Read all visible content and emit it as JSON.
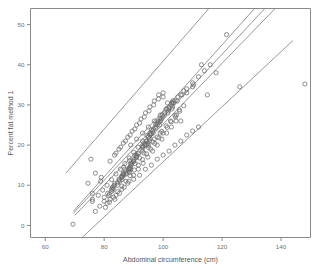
{
  "chart_data": {
    "type": "scatter",
    "title": "",
    "subtitle": "",
    "xlabel": "Abdominal circumference (cm)",
    "ylabel": "Percent fat method 1",
    "xlim": [
      55,
      150
    ],
    "ylim": [
      -3,
      54
    ],
    "xticks": [
      60,
      80,
      100,
      120,
      140
    ],
    "xticklabels": [
      "60",
      "80",
      "100",
      "120",
      "140"
    ],
    "yticks": [
      0,
      10,
      20,
      30,
      40,
      50
    ],
    "yticklabels": [
      "0",
      "10",
      "20",
      "30",
      "40",
      "50"
    ],
    "grid": false,
    "legend": "none",
    "marker": "open-circle",
    "marker_color": "#6b6b6b",
    "line_color": "#6b6b6b",
    "frame_color": "#8a8a8a",
    "series": [
      {
        "name": "Percent fat method 1 vs abdominal circumference",
        "type": "scatter",
        "x": [
          69.4,
          78.8,
          86.6,
          88.6,
          82.5,
          83.6,
          90.9,
          88.5,
          82.5,
          88.6,
          83.3,
          85.1,
          95.5,
          88.2,
          85.3,
          76.0,
          95.0,
          101.8,
          88.6,
          90.4,
          95.6,
          91.6,
          93.9,
          103.0,
          95.4,
          96.6,
          98.8,
          95.4,
          88.7,
          94.8,
          88.5,
          86.0,
          81.2,
          82.8,
          94.4,
          86.7,
          93.2,
          86.0,
          97.3,
          98.4,
          81.8,
          99.5,
          98.0,
          76.0,
          86.5,
          87.4,
          90.2,
          90.0,
          86.0,
          80.0,
          83.4,
          95.0,
          92.8,
          85.0,
          89.4,
          102.7,
          100.0,
          99.1,
          110.3,
          103.3,
          97.8,
          96.4,
          92.9,
          95.8,
          89.8,
          91.0,
          87.4,
          93.8,
          110.0,
          99.7,
          86.4,
          96.7,
          94.2,
          89.2,
          88.9,
          101.3,
          98.3,
          93.5,
          91.0,
          86.5,
          83.0,
          84.5,
          86.0,
          88.5,
          90.0,
          91.5,
          93.0,
          94.5,
          96.0,
          97.5,
          99.0,
          100.5,
          102.0,
          103.5,
          78.0,
          79.5,
          81.0,
          82.5,
          84.0,
          85.5,
          87.0,
          88.5,
          90.0,
          91.5,
          93.0,
          94.5,
          96.0,
          97.5,
          99.0,
          100.5,
          102.0,
          104.0,
          106.0,
          108.0,
          110.0,
          112.0,
          114.0,
          116.0,
          118.0,
          121.5,
          126.0,
          148.1,
          83.6,
          85.2,
          86.8,
          88.4,
          90.0,
          91.6,
          93.2,
          94.8,
          96.4,
          98.0,
          99.6,
          101.2,
          102.8,
          104.4,
          80.4,
          81.8,
          83.2,
          84.6,
          86.0,
          87.4,
          88.8,
          90.2,
          91.6,
          93.0,
          94.4,
          95.8,
          97.2,
          98.6,
          100.0,
          101.4,
          102.8,
          104.2,
          105.6,
          107.0,
          77.0,
          78.5,
          80.0,
          81.5,
          83.0,
          84.5,
          86.0,
          87.5,
          89.0,
          90.5,
          92.0,
          93.5,
          95.0,
          96.5,
          98.0,
          99.5,
          101.0,
          102.5,
          104.0,
          105.5,
          74.5,
          76.0,
          84.0,
          85.6,
          87.2,
          88.8,
          90.4,
          92.0,
          93.6,
          95.2,
          96.8,
          98.4,
          100.0,
          101.6,
          103.2,
          104.8,
          106.4,
          108.0,
          113.0,
          115.0,
          82.0,
          83.5,
          85.0,
          86.5,
          88.0,
          89.5,
          91.0,
          92.5,
          94.0,
          95.5,
          97.0,
          98.5,
          100.0,
          101.5,
          103.0,
          104.5,
          106.0,
          75.5,
          77.0,
          79.0,
          81.0,
          82.0,
          84.0,
          86.0,
          88.0,
          90.0,
          92.0,
          94.0,
          96.0,
          98.0,
          100.0,
          102.0,
          104.0,
          106.0,
          108.0,
          110.0,
          112.0,
          89.0,
          91.0,
          93.0,
          95.0,
          97.0,
          99.0,
          101.0,
          103.0,
          105.0,
          107.0,
          87.0,
          89.0,
          91.0,
          93.0,
          95.0,
          97.0,
          99.0
        ],
        "y": [
          0.3,
          11.0,
          14.5,
          16.1,
          9.0,
          10.5,
          17.0,
          14.0,
          8.5,
          13.2,
          9.8,
          11.3,
          23.0,
          13.5,
          11.0,
          6.5,
          22.0,
          28.5,
          13.8,
          17.5,
          22.5,
          18.0,
          20.0,
          30.5,
          21.6,
          23.0,
          25.0,
          21.0,
          14.5,
          20.5,
          14.3,
          12.0,
          8.0,
          9.5,
          20.0,
          12.5,
          19.5,
          12.2,
          24.5,
          25.5,
          7.8,
          26.5,
          25.0,
          6.0,
          12.8,
          13.5,
          16.5,
          16.0,
          12.3,
          7.0,
          10.0,
          22.0,
          19.0,
          11.5,
          15.5,
          30.0,
          27.0,
          26.0,
          35.0,
          31.0,
          25.5,
          23.5,
          19.8,
          22.8,
          15.8,
          17.2,
          13.0,
          20.2,
          34.5,
          27.5,
          12.6,
          24.0,
          21.0,
          15.0,
          14.8,
          29.0,
          26.0,
          20.5,
          17.5,
          13.0,
          9.2,
          10.6,
          12.0,
          14.2,
          16.0,
          17.8,
          19.5,
          21.0,
          22.8,
          24.2,
          26.0,
          27.5,
          29.0,
          30.5,
          7.5,
          8.8,
          10.0,
          11.4,
          12.8,
          14.0,
          15.4,
          16.8,
          18.2,
          19.5,
          21.0,
          22.4,
          23.8,
          25.2,
          26.6,
          28.0,
          29.4,
          31.0,
          32.5,
          34.0,
          35.5,
          37.0,
          38.5,
          40.0,
          38.0,
          47.5,
          34.5,
          35.2,
          6.5,
          8.0,
          9.5,
          11.0,
          12.5,
          14.0,
          15.5,
          17.0,
          18.5,
          20.0,
          21.5,
          23.0,
          24.5,
          26.0,
          4.5,
          5.8,
          7.0,
          8.4,
          9.8,
          11.0,
          12.4,
          13.8,
          15.0,
          16.4,
          17.8,
          19.0,
          20.4,
          21.8,
          23.0,
          24.4,
          25.8,
          27.0,
          28.4,
          29.8,
          3.5,
          4.8,
          6.0,
          7.4,
          8.8,
          10.0,
          11.4,
          12.8,
          14.0,
          15.4,
          16.8,
          18.0,
          19.4,
          20.8,
          22.0,
          23.4,
          24.8,
          26.0,
          27.4,
          28.8,
          10.5,
          8.0,
          18.0,
          19.5,
          21.0,
          22.5,
          24.0,
          25.5,
          27.0,
          28.5,
          30.0,
          31.5,
          33.0,
          28.0,
          29.5,
          31.0,
          32.5,
          33.0,
          40.0,
          32.5,
          16.0,
          17.5,
          19.0,
          20.5,
          22.0,
          23.5,
          25.0,
          26.5,
          28.0,
          29.5,
          31.0,
          32.5,
          32.0,
          30.5,
          29.0,
          27.5,
          26.0,
          16.5,
          13.0,
          12.0,
          5.5,
          6.5,
          7.5,
          9.0,
          10.5,
          11.5,
          12.5,
          14.0,
          15.0,
          16.5,
          17.5,
          18.5,
          20.0,
          21.0,
          22.5,
          23.5,
          24.5,
          20.0,
          21.5,
          23.0,
          24.5,
          26.0,
          27.5,
          29.0,
          30.5,
          32.0,
          33.5,
          14.0,
          15.5,
          17.0,
          18.5,
          20.0,
          21.5,
          23.0
        ]
      }
    ],
    "lines": [
      {
        "name": "upper-prediction-limit",
        "x0": 67.0,
        "y0": 13.0,
        "x1": 115.5,
        "y1": 54.0
      },
      {
        "name": "upper-confidence-limit",
        "x0": 69.5,
        "y0": 3.5,
        "x1": 131.0,
        "y1": 54.0
      },
      {
        "name": "regression-line",
        "x0": 69.5,
        "y0": 3.0,
        "x1": 134.5,
        "y1": 54.0
      },
      {
        "name": "lower-confidence-limit",
        "x0": 70.0,
        "y0": 2.5,
        "x1": 138.0,
        "y1": 54.0
      },
      {
        "name": "lower-prediction-limit",
        "x0": 72.5,
        "y0": -3.0,
        "x1": 144.0,
        "y1": 46.0
      }
    ]
  }
}
